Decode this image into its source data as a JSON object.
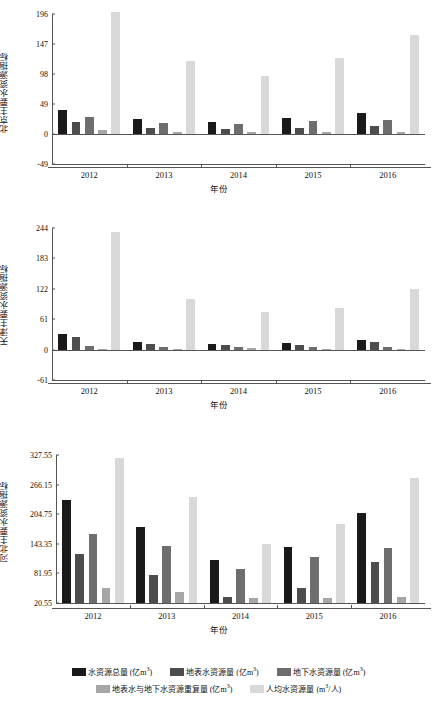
{
  "colors": {
    "total": "#1a1a1a",
    "surface": "#4d4d4d",
    "ground": "#6e6e6e",
    "overlap": "#a6a6a6",
    "percapita": "#d9d9d9",
    "axis": "#555555",
    "text": "#111111"
  },
  "legend": {
    "row1": [
      {
        "key": "total",
        "label": "水资源总量 (亿m³)",
        "color": "#1a1a1a"
      },
      {
        "key": "surface",
        "label": "地表水资源量 (亿m³)",
        "color": "#4d4d4d"
      },
      {
        "key": "ground",
        "label": "地下水资源量 (亿m³)",
        "color": "#6e6e6e"
      }
    ],
    "row2": [
      {
        "key": "overlap",
        "label": "地表水与地下水资源重复量 (亿m³)",
        "color": "#a6a6a6"
      },
      {
        "key": "percapita",
        "label": "人均水资源量 (m³/人)",
        "color": "#d9d9d9"
      }
    ]
  },
  "chart_data": [
    {
      "type": "bar",
      "title": "",
      "xlabel": "年份",
      "ylabel": "北京主要水资源指标",
      "categories": [
        "2012",
        "2013",
        "2014",
        "2015",
        "2016"
      ],
      "ylim": [
        -49,
        196
      ],
      "yticks": [
        196,
        147,
        98,
        49,
        0,
        -49
      ],
      "grid": false,
      "legend_position": "bottom",
      "series": [
        {
          "name": "水资源总量 (亿m³)",
          "color": "#1a1a1a",
          "values": [
            39.5,
            24.8,
            20.2,
            26.8,
            35.1
          ]
        },
        {
          "name": "地表水资源量 (亿m³)",
          "color": "#4d4d4d",
          "values": [
            19.4,
            10.1,
            7.7,
            10.3,
            13.8
          ]
        },
        {
          "name": "地下水资源量 (亿m³)",
          "color": "#6e6e6e",
          "values": [
            27.0,
            18.7,
            16.1,
            20.5,
            23.7
          ]
        },
        {
          "name": "地表水与地下水资源重复量 (亿m³)",
          "color": "#a6a6a6",
          "values": [
            6.9,
            4.0,
            3.6,
            4.0,
            4.0
          ]
        },
        {
          "name": "人均水资源量 (m³/人)",
          "color": "#d9d9d9",
          "values": [
            200.0,
            119.0,
            94.5,
            123.8,
            161.6
          ]
        }
      ]
    },
    {
      "type": "bar",
      "title": "",
      "xlabel": "年份",
      "ylabel": "天津主要水资源指标",
      "categories": [
        "2012",
        "2013",
        "2014",
        "2015",
        "2016"
      ],
      "ylim": [
        -61,
        244
      ],
      "yticks": [
        244,
        183,
        122,
        61,
        0,
        -61
      ],
      "grid": false,
      "legend_position": "bottom",
      "series": [
        {
          "name": "水资源总量 (亿m³)",
          "color": "#1a1a1a",
          "values": [
            30.8,
            14.6,
            11.4,
            12.8,
            18.9
          ]
        },
        {
          "name": "地表水资源量 (亿m³)",
          "color": "#4d4d4d",
          "values": [
            25.9,
            11.1,
            9.4,
            10.2,
            14.3
          ]
        },
        {
          "name": "地下水资源量 (亿m³)",
          "color": "#6e6e6e",
          "values": [
            6.8,
            5.2,
            4.5,
            4.8,
            6.1
          ]
        },
        {
          "name": "地表水与地下水资源重复量 (亿m³)",
          "color": "#a6a6a6",
          "values": [
            1.9,
            1.7,
            2.5,
            2.2,
            1.5
          ]
        },
        {
          "name": "人均水资源量 (m³/人)",
          "color": "#d9d9d9",
          "values": [
            236.0,
            102.0,
            76.0,
            83.0,
            121.5
          ]
        }
      ]
    },
    {
      "type": "bar",
      "title": "",
      "xlabel": "年份",
      "ylabel": "河北主要水资源指标",
      "categories": [
        "2012",
        "2013",
        "2014",
        "2015",
        "2016"
      ],
      "ylim": [
        20.55,
        327.55
      ],
      "yticks": [
        327.55,
        266.15,
        204.75,
        143.35,
        81.95,
        20.55
      ],
      "grid": false,
      "legend_position": "bottom",
      "series": [
        {
          "name": "水资源总量 (亿m³)",
          "color": "#1a1a1a",
          "values": [
            235.1,
            177.4,
            110.0,
            137.0,
            207.0
          ]
        },
        {
          "name": "地表水资源量 (亿m³)",
          "color": "#4d4d4d",
          "values": [
            122.0,
            79.7,
            32.0,
            51.0,
            105.0
          ]
        },
        {
          "name": "地下水资源量 (亿m³)",
          "color": "#6e6e6e",
          "values": [
            164.0,
            139.0,
            91.5,
            116.0,
            135.0
          ]
        },
        {
          "name": "地表水与地下水资源重复量 (亿m³)",
          "color": "#a6a6a6",
          "values": [
            51.0,
            43.0,
            31.0,
            31.0,
            32.0
          ]
        },
        {
          "name": "人均水资源量 (m³/人)",
          "color": "#d9d9d9",
          "values": [
            322.0,
            240.0,
            144.0,
            184.0,
            279.0
          ]
        }
      ]
    }
  ]
}
